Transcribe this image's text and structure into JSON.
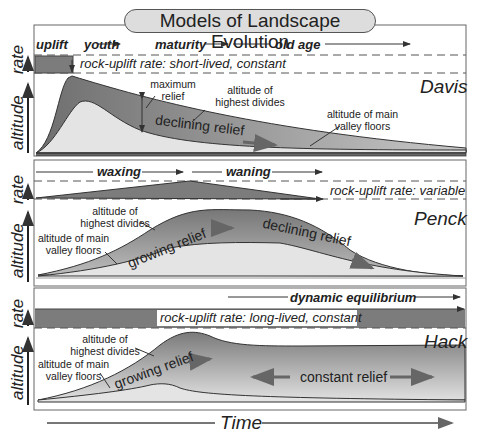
{
  "title": "Models of Landscape Evolution",
  "x_axis_label": "Time",
  "panels": [
    {
      "model": "Davis",
      "phases": [
        "uplift",
        "youth",
        "maturity",
        "old age"
      ],
      "rate_label": "rock-uplift rate: short-lived, constant",
      "axis_rate": "rate",
      "axis_altitude": "altitude",
      "annotations": {
        "max_relief": "maximum relief",
        "divides": "altitude of highest divides",
        "valley": "altitude of main valley floors",
        "relief": "declining relief"
      }
    },
    {
      "model": "Penck",
      "phases": [
        "waxing",
        "waning"
      ],
      "rate_label": "rock-uplift rate: variable",
      "axis_rate": "rate",
      "axis_altitude": "altitude",
      "annotations": {
        "divides": "altitude of highest divides",
        "valley": "altitude of main valley floors",
        "relief_growing": "growing relief",
        "relief_declining": "declining relief"
      }
    },
    {
      "model": "Hack",
      "phases": [
        "dynamic equilibrium"
      ],
      "rate_label": "rock-uplift rate: long-lived, constant",
      "axis_rate": "rate",
      "axis_altitude": "altitude",
      "annotations": {
        "divides": "altitude of highest divides",
        "valley": "altitude of main valley floors",
        "relief_growing": "growing relief",
        "relief_constant": "constant relief"
      }
    }
  ],
  "colors": {
    "dark_fill": "#7a7a7a",
    "mid_fill": "#a8a8a8",
    "light_fill": "#e2e2e2",
    "outline": "#333333"
  }
}
